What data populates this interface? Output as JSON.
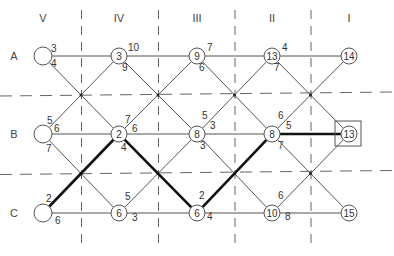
{
  "columns": [
    {
      "label": "V",
      "x": 43
    },
    {
      "label": "IV",
      "x": 119
    },
    {
      "label": "III",
      "x": 197
    },
    {
      "label": "II",
      "x": 272
    },
    {
      "label": "I",
      "x": 349
    }
  ],
  "rows": [
    {
      "label": "A",
      "y": 56
    },
    {
      "label": "B",
      "y": 134
    },
    {
      "label": "C",
      "y": 213
    }
  ],
  "nodes": [
    {
      "id": "A-V",
      "value": "",
      "col": 0,
      "row": 0,
      "r": 9
    },
    {
      "id": "A-IV",
      "value": "3",
      "col": 1,
      "row": 0,
      "r": 8
    },
    {
      "id": "A-III",
      "value": "9",
      "col": 2,
      "row": 0,
      "r": 8
    },
    {
      "id": "A-II",
      "value": "13",
      "col": 3,
      "row": 0,
      "r": 8
    },
    {
      "id": "A-I",
      "value": "14",
      "col": 4,
      "row": 0,
      "r": 8
    },
    {
      "id": "B-V",
      "value": "",
      "col": 0,
      "row": 1,
      "r": 9
    },
    {
      "id": "B-IV",
      "value": "2",
      "col": 1,
      "row": 1,
      "r": 8
    },
    {
      "id": "B-III",
      "value": "8",
      "col": 2,
      "row": 1,
      "r": 8
    },
    {
      "id": "B-II",
      "value": "8",
      "col": 3,
      "row": 1,
      "r": 8
    },
    {
      "id": "B-I",
      "value": "13",
      "col": 4,
      "row": 1,
      "r": 8,
      "boxed": true
    },
    {
      "id": "C-V",
      "value": "",
      "col": 0,
      "row": 2,
      "r": 9
    },
    {
      "id": "C-IV",
      "value": "6",
      "col": 1,
      "row": 2,
      "r": 8
    },
    {
      "id": "C-III",
      "value": "6",
      "col": 2,
      "row": 2,
      "r": 8
    },
    {
      "id": "C-II",
      "value": "10",
      "col": 3,
      "row": 2,
      "r": 8
    },
    {
      "id": "C-I",
      "value": "15",
      "col": 4,
      "row": 2,
      "r": 8
    }
  ],
  "edge_weights": [
    {
      "text": "3",
      "x": 51,
      "y": 52
    },
    {
      "text": "4",
      "x": 51,
      "y": 67
    },
    {
      "text": "10",
      "x": 128,
      "y": 51
    },
    {
      "text": "9",
      "x": 122,
      "y": 71
    },
    {
      "text": "7",
      "x": 207,
      "y": 51
    },
    {
      "text": "6",
      "x": 199,
      "y": 71
    },
    {
      "text": "4",
      "x": 282,
      "y": 51
    },
    {
      "text": "7",
      "x": 274,
      "y": 71
    },
    {
      "text": "5",
      "x": 47,
      "y": 124
    },
    {
      "text": "6",
      "x": 54,
      "y": 132
    },
    {
      "text": "7",
      "x": 46,
      "y": 152
    },
    {
      "text": "7",
      "x": 125,
      "y": 123
    },
    {
      "text": "6",
      "x": 132,
      "y": 132
    },
    {
      "text": "4",
      "x": 121,
      "y": 151
    },
    {
      "text": "5",
      "x": 202,
      "y": 119
    },
    {
      "text": "3",
      "x": 210,
      "y": 129
    },
    {
      "text": "3",
      "x": 200,
      "y": 149
    },
    {
      "text": "6",
      "x": 278,
      "y": 119
    },
    {
      "text": "5",
      "x": 286,
      "y": 129
    },
    {
      "text": "7",
      "x": 278,
      "y": 149
    },
    {
      "text": "2",
      "x": 46,
      "y": 202
    },
    {
      "text": "6",
      "x": 55,
      "y": 224
    },
    {
      "text": "5",
      "x": 125,
      "y": 200
    },
    {
      "text": "3",
      "x": 132,
      "y": 221
    },
    {
      "text": "2",
      "x": 199,
      "y": 199
    },
    {
      "text": "4",
      "x": 207,
      "y": 220
    },
    {
      "text": "6",
      "x": 278,
      "y": 199
    },
    {
      "text": "8",
      "x": 285,
      "y": 220
    }
  ],
  "highlighted_path": [
    "C-V",
    "B-IV",
    "C-III",
    "B-II",
    "B-I"
  ],
  "colors": {
    "line": "#555555",
    "path": "#111111",
    "dash": "#666666",
    "text": "#333333"
  }
}
